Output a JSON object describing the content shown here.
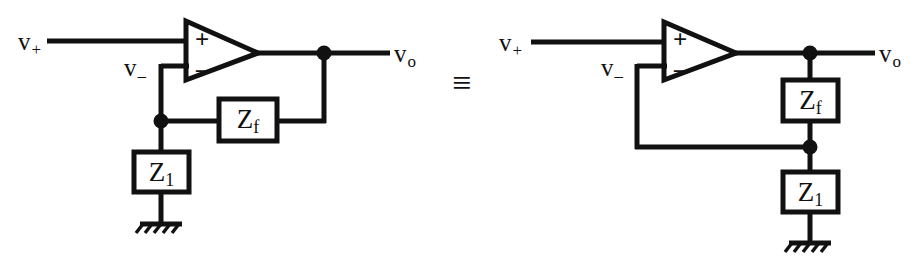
{
  "figure": {
    "equivalence_symbol": "≡",
    "ink_color": "#111111",
    "background_color": "#ffffff"
  },
  "left_circuit": {
    "name": "feedback-drawn-as-horizontal-ladder",
    "labels": {
      "noninverting_input": "v",
      "noninverting_input_sub": "+",
      "inverting_input": "v",
      "inverting_input_sub": "–",
      "output": "v",
      "output_sub": "o"
    },
    "opamp": {
      "plus_pin": "+",
      "minus_pin": "–"
    },
    "components": [
      {
        "id": "zf",
        "label": "Z",
        "sub": "f",
        "orientation": "horizontal"
      },
      {
        "id": "z1",
        "label": "Z",
        "sub": "1",
        "orientation": "vertical"
      }
    ],
    "ground_symbol": "earth-ground"
  },
  "right_circuit": {
    "name": "feedback-drawn-as-vertical-divider",
    "labels": {
      "noninverting_input": "v",
      "noninverting_input_sub": "+",
      "inverting_input": "v",
      "inverting_input_sub": "–",
      "output": "v",
      "output_sub": "o"
    },
    "opamp": {
      "plus_pin": "+",
      "minus_pin": "–"
    },
    "components": [
      {
        "id": "zf",
        "label": "Z",
        "sub": "f",
        "orientation": "vertical"
      },
      {
        "id": "z1",
        "label": "Z",
        "sub": "1",
        "orientation": "vertical"
      }
    ],
    "ground_symbol": "earth-ground"
  }
}
